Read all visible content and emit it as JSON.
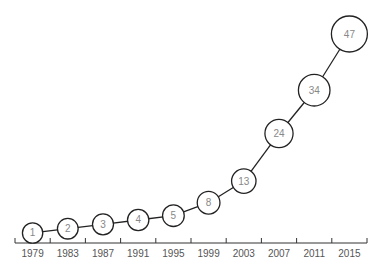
{
  "chart_data": {
    "type": "line",
    "title": "",
    "xlabel": "",
    "ylabel": "",
    "categories": [
      "1979",
      "1983",
      "1987",
      "1991",
      "1995",
      "1999",
      "2003",
      "2007",
      "2011",
      "2015"
    ],
    "values": [
      1,
      2,
      3,
      4,
      5,
      8,
      13,
      24,
      34,
      47
    ],
    "data_labels": [
      "1",
      "2",
      "3",
      "4",
      "5",
      "8",
      "13",
      "24",
      "34",
      "47"
    ],
    "marker": "circle-with-value",
    "ylim": [
      0,
      47
    ],
    "grid": false,
    "legend": "none"
  }
}
